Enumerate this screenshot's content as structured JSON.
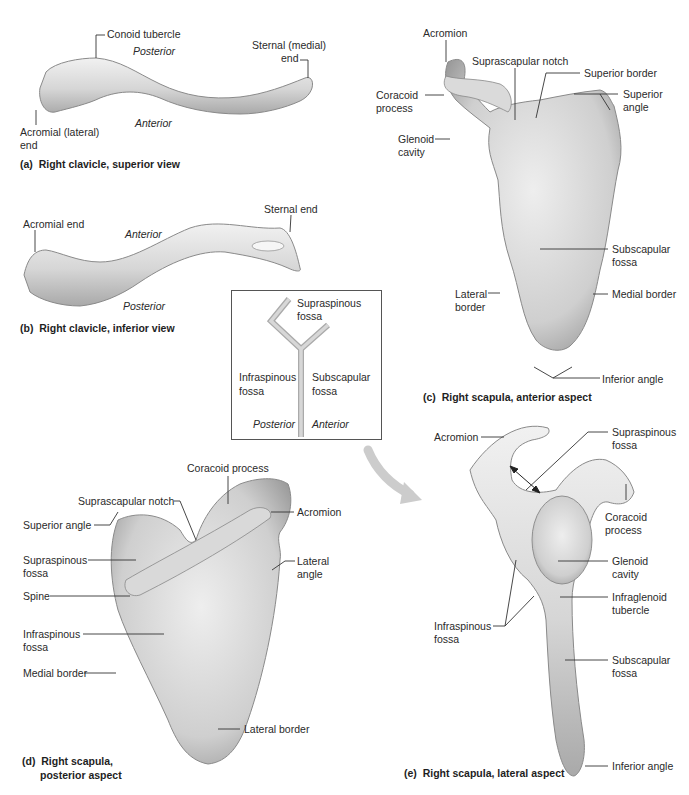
{
  "figure": {
    "panel_a": {
      "caption": "(a)  Right clavicle, superior view",
      "labels": {
        "conoid_tubercle": "Conoid tubercle",
        "posterior": "Posterior",
        "sternal_end_l1": "Sternal (medial)",
        "sternal_end_l2": "end",
        "acromial_end_l1": "Acromial (lateral)",
        "acromial_end_l2": "end",
        "anterior": "Anterior"
      }
    },
    "panel_b": {
      "caption": "(b)  Right clavicle, inferior view",
      "labels": {
        "acromial_end": "Acromial end",
        "anterior": "Anterior",
        "sternal_end": "Sternal end",
        "posterior": "Posterior"
      }
    },
    "panel_c": {
      "caption": "(c)  Right scapula, anterior aspect",
      "labels": {
        "acromion": "Acromion",
        "suprascapular_notch": "Suprascapular notch",
        "superior_border": "Superior border",
        "coracoid_l1": "Coracoid",
        "coracoid_l2": "process",
        "superior_angle_l1": "Superior",
        "superior_angle_l2": "angle",
        "glenoid_l1": "Glenoid",
        "glenoid_l2": "cavity",
        "subscapular_l1": "Subscapular",
        "subscapular_l2": "fossa",
        "lateral_l1": "Lateral",
        "lateral_l2": "border",
        "medial_border": "Medial border",
        "inferior_angle": "Inferior angle"
      }
    },
    "panel_d": {
      "caption_l1": "(d)  Right scapula,",
      "caption_l2": "posterior aspect",
      "labels": {
        "coracoid_process": "Coracoid process",
        "suprascapular_notch": "Suprascapular notch",
        "acromion": "Acromion",
        "superior_angle": "Superior angle",
        "supraspinous_l1": "Supraspinous",
        "supraspinous_l2": "fossa",
        "lateral_angle_l1": "Lateral",
        "lateral_angle_l2": "angle",
        "spine": "Spine",
        "infraspinous_l1": "Infraspinous",
        "infraspinous_l2": "fossa",
        "medial_border": "Medial border",
        "lateral_border": "Lateral border"
      }
    },
    "panel_e": {
      "caption": "(e)  Right scapula, lateral aspect",
      "labels": {
        "acromion": "Acromion",
        "supraspinous_l1": "Supraspinous",
        "supraspinous_l2": "fossa",
        "coracoid_l1": "Coracoid",
        "coracoid_l2": "process",
        "glenoid_l1": "Glenoid",
        "glenoid_l2": "cavity",
        "infraglenoid_l1": "Infraglenoid",
        "infraglenoid_l2": "tubercle",
        "infraspinous_l1": "Infraspinous",
        "infraspinous_l2": "fossa",
        "subscapular_l1": "Subscapular",
        "subscapular_l2": "fossa",
        "inferior_angle": "Inferior angle"
      }
    },
    "inset": {
      "supraspinous_l1": "Supraspinous",
      "supraspinous_l2": "fossa",
      "infraspinous_l1": "Infraspinous",
      "infraspinous_l2": "fossa",
      "subscapular_l1": "Subscapular",
      "subscapular_l2": "fossa",
      "posterior": "Posterior",
      "anterior": "Anterior"
    }
  },
  "colors": {
    "bone_light": "#e9e9e9",
    "bone_mid": "#c8c8c8",
    "bone_dark": "#8e8e8e",
    "leader": "#333333",
    "arrow": "#c9c9c9"
  }
}
